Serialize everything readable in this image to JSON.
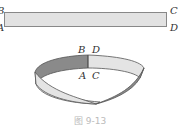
{
  "figure": {
    "caption": "图 9-13",
    "strip_labels": {
      "top_left": "B",
      "bottom_left": "A",
      "top_right": "C",
      "bottom_right": "D"
    },
    "mobius_labels": {
      "top_left": "B",
      "top_right": "D",
      "bottom_left": "A",
      "bottom_right": "C"
    },
    "colors": {
      "dark_face": "#8a8a8a",
      "light_face": "#e4e4e4",
      "edge": "#555555"
    }
  }
}
